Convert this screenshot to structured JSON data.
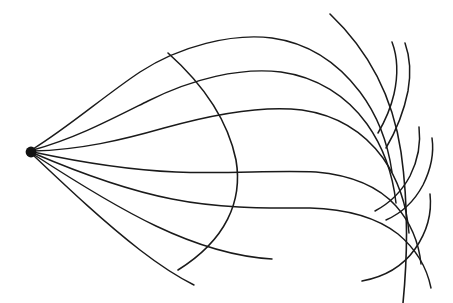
{
  "figure": {
    "kind": "line-art-diagram",
    "width": 453,
    "height": 303,
    "background_color": "#ffffff",
    "stroke_color": "#1a1a1a",
    "stroke_width": 1.45
  },
  "source": {
    "name": "point-source",
    "label": "",
    "cx": 31,
    "cy": 152,
    "r": 5.4,
    "color": "#111111"
  },
  "rays": [
    {
      "id": "ray-1",
      "label": "",
      "d": "M 33 149 C 70 126 104 96 140 72 C 180 46 232 33 272 38 C 308 43 338 63 360 92 C 378 116 388 144 392 172"
    },
    {
      "id": "ray-2",
      "label": "",
      "d": "M 33 150 C 74 139 110 120 148 101 C 192 79 240 67 281 72 C 317 77 347 96 367 124 C 384 148 393 176 396 203"
    },
    {
      "id": "ray-3",
      "label": "",
      "d": "M 33 151 C 80 150 122 140 164 128 C 214 114 262 105 302 110 C 336 115 364 132 383 158 C 399 181 407 208 409 233"
    },
    {
      "id": "ray-4",
      "label": "",
      "d": "M 33 152 C 84 163 128 170 176 172 C 228 174 276 170 316 172 C 350 175 378 186 396 206 C 411 223 419 244 421 264"
    },
    {
      "id": "ray-5",
      "label": "",
      "d": "M 33 153 C 82 174 126 190 172 199 C 222 209 270 208 310 208 C 346 209 376 217 398 234 C 416 249 427 268 431 288"
    },
    {
      "id": "ray-6",
      "label": "",
      "d": "M 33 154 C 76 182 116 207 156 226 C 198 246 238 257 272 259"
    },
    {
      "id": "ray-7",
      "label": "",
      "d": "M 33 155 C 70 190 104 222 140 250 C 162 267 180 278 194 285"
    }
  ],
  "wavefronts": [
    {
      "id": "wavefront-inner",
      "label": "",
      "d": "M 168 53 C 205 86 228 121 236 160 C 243 201 226 240 178 270"
    },
    {
      "id": "wavefront-outer",
      "label": "",
      "d": "M 330 14 C 370 52 393 98 401 152 C 409 208 407 262 403 303"
    }
  ],
  "cusps": [
    {
      "id": "cusp-upper",
      "label": "",
      "d": "M 378 133 C 385 121 391 107 394 94 C 398 76 398 58 392 42"
    },
    {
      "id": "cusp-upper-inner",
      "label": "",
      "d": "M 386 148 C 396 131 404 111 408 91 C 411 74 410 57 405 43"
    },
    {
      "id": "cusp-mid",
      "label": "",
      "d": "M 375 211 C 390 203 402 191 410 176 C 418 160 421 143 419 127"
    },
    {
      "id": "cusp-mid-inner",
      "label": "",
      "d": "M 386 220 C 402 213 415 200 423 185 C 431 169 434 152 432 138"
    },
    {
      "id": "cusp-lower",
      "label": "",
      "d": "M 362 281 C 384 277 403 266 415 249 C 427 232 432 212 430 194"
    }
  ]
}
